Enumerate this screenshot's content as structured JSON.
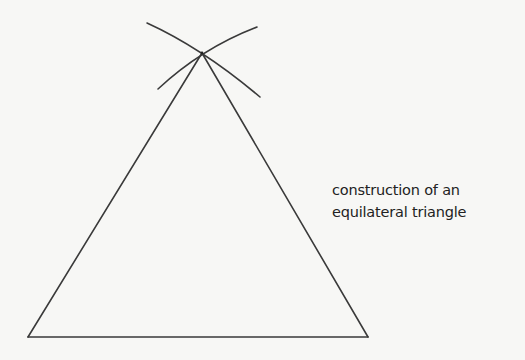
{
  "diagram": {
    "type": "geometric-construction",
    "caption": {
      "line1": "construction of an",
      "line2": "equilateral triangle"
    },
    "colors": {
      "background": "#f7f7f5",
      "stroke": "#3a3a3a",
      "text": "#222222"
    },
    "triangle": {
      "vertices": {
        "apex": [
          202,
          53
        ],
        "bottom_left": [
          28,
          337
        ],
        "bottom_right": [
          368,
          337
        ]
      }
    },
    "construction_arcs": [
      {
        "name": "arc-centered-bottom-left",
        "start": [
          147,
          23
        ],
        "end": [
          260,
          97
        ]
      },
      {
        "name": "arc-centered-bottom-right",
        "start": [
          158,
          89
        ],
        "end": [
          257,
          27
        ]
      }
    ]
  }
}
